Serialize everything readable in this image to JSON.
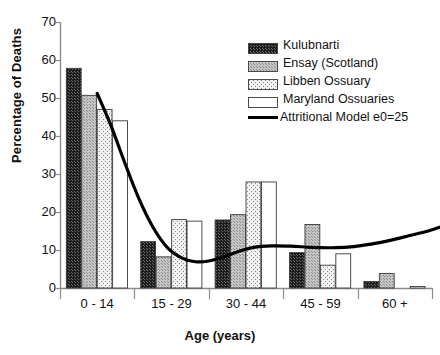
{
  "chart_data": {
    "type": "bar",
    "title": "",
    "xlabel": "Age (years)",
    "ylabel": "Percentage of Deaths",
    "categories": [
      "0 - 14",
      "15 - 29",
      "30 - 44",
      "45 - 59",
      "60 +"
    ],
    "ylim": [
      0,
      70
    ],
    "yticks": [
      0,
      10,
      20,
      30,
      40,
      50,
      60,
      70
    ],
    "ytick_labels": [
      "0",
      "10",
      "20",
      "30",
      "40",
      "50",
      "60",
      "70"
    ],
    "grid": false,
    "legend_position": "top-right",
    "series": [
      {
        "name": "Kulubnarti",
        "fill": "dense-black-checker",
        "color": "#1a1a1a",
        "values": [
          57.8,
          12.2,
          17.9,
          9.3,
          1.7
        ]
      },
      {
        "name": "Ensay (Scotland)",
        "fill": "gray-fine-dots",
        "color": "#b3b3b3",
        "values": [
          50.7,
          8.2,
          19.3,
          16.7,
          3.8
        ]
      },
      {
        "name": "Libben Ossuary",
        "fill": "light-sparse-dots",
        "color": "#ededed",
        "values": [
          47.0,
          18.0,
          27.9,
          6.0,
          0.0
        ]
      },
      {
        "name": "Maryland Ossuaries",
        "fill": "white",
        "color": "#ffffff",
        "values": [
          44.0,
          17.6,
          27.9,
          9.0,
          0.4
        ]
      }
    ],
    "overlay_line": {
      "name": "Attritional Model e0=25",
      "color": "#000000",
      "points": [
        {
          "x": 0.0,
          "y": 51.2
        },
        {
          "x": 0.18,
          "y": 43.0
        },
        {
          "x": 0.36,
          "y": 33.5
        },
        {
          "x": 0.55,
          "y": 24.0
        },
        {
          "x": 0.75,
          "y": 16.0
        },
        {
          "x": 0.95,
          "y": 10.5
        },
        {
          "x": 1.15,
          "y": 7.8
        },
        {
          "x": 1.32,
          "y": 6.9
        },
        {
          "x": 1.5,
          "y": 7.1
        },
        {
          "x": 1.7,
          "y": 8.2
        },
        {
          "x": 1.9,
          "y": 9.6
        },
        {
          "x": 2.1,
          "y": 10.7
        },
        {
          "x": 2.35,
          "y": 11.1
        },
        {
          "x": 2.6,
          "y": 11.0
        },
        {
          "x": 2.9,
          "y": 10.7
        },
        {
          "x": 3.2,
          "y": 10.6
        },
        {
          "x": 3.45,
          "y": 10.9
        },
        {
          "x": 3.7,
          "y": 11.6
        },
        {
          "x": 3.95,
          "y": 12.6
        },
        {
          "x": 4.2,
          "y": 13.8
        },
        {
          "x": 4.45,
          "y": 15.0
        },
        {
          "x": 4.62,
          "y": 16.1
        }
      ]
    }
  },
  "legend": {
    "items": [
      {
        "label": "Kulubnarti"
      },
      {
        "label": "Ensay (Scotland)"
      },
      {
        "label": "Libben Ossuary"
      },
      {
        "label": "Maryland Ossuaries"
      },
      {
        "label": "Attritional Model e0=25"
      }
    ]
  }
}
